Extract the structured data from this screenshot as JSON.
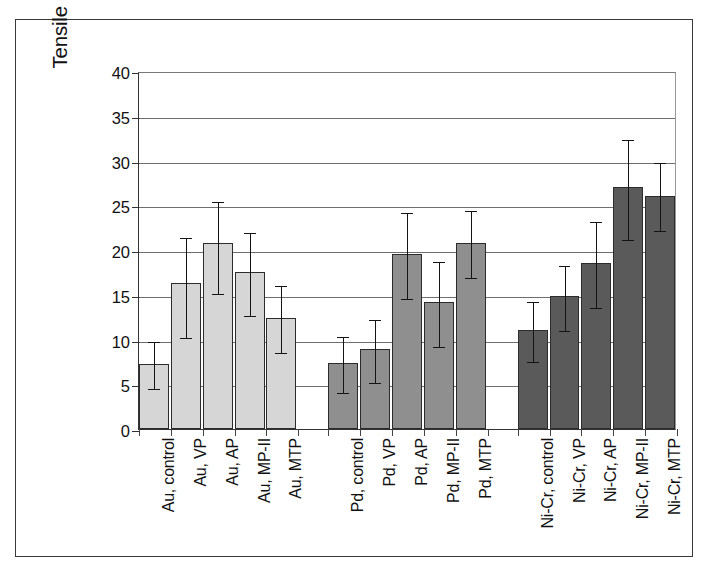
{
  "chart_data": {
    "type": "bar",
    "title": "",
    "xlabel": "",
    "ylabel": "Tensile bond strength (MPa)",
    "ylim": [
      0,
      40
    ],
    "yticks": [
      0,
      5,
      10,
      15,
      20,
      25,
      30,
      35,
      40
    ],
    "ytick_labels": [
      "0",
      "5",
      "10",
      "15",
      "20",
      "25",
      "30",
      "35",
      "40"
    ],
    "grid": true,
    "legend": "none",
    "error_bars": "yes",
    "categories": [
      "Au, control",
      "Au, VP",
      "Au, AP",
      "Au, MP-II",
      "Au, MTP",
      "Pd, control",
      "Pd, VP",
      "Pd, AP",
      "Pd, MP-II",
      "Pd, MTP",
      "Ni-Cr, control",
      "Ni-Cr, VP",
      "Ni-Cr, AP",
      "Ni-Cr, MP-II",
      "Ni-Cr, MTP"
    ],
    "values": [
      7.3,
      16.3,
      20.8,
      17.5,
      12.4,
      7.4,
      8.9,
      19.5,
      14.2,
      20.8,
      11.1,
      14.9,
      18.5,
      27.0,
      26.0
    ],
    "err_low": [
      4.7,
      10.4,
      15.3,
      12.9,
      8.7,
      4.3,
      5.4,
      14.8,
      9.4,
      17.1,
      7.7,
      11.2,
      13.7,
      21.3,
      22.3
    ],
    "err_high": [
      10.0,
      21.6,
      25.6,
      22.1,
      16.2,
      10.5,
      12.4,
      24.4,
      18.9,
      24.6,
      14.4,
      18.4,
      23.3,
      32.5,
      30.0
    ],
    "groups": [
      {
        "name": "Au",
        "color": "#d6d6d6",
        "start": 0,
        "count": 5
      },
      {
        "name": "Pd",
        "color": "#8f8f8f",
        "start": 5,
        "count": 5
      },
      {
        "name": "Ni-Cr",
        "color": "#5a5a5a",
        "start": 10,
        "count": 5
      }
    ],
    "colors": {
      "au_bar": "#d6d6d6",
      "pd_bar": "#8f8f8f",
      "nicr_bar": "#5a5a5a",
      "axis": "#333333",
      "gridline": "#6e6e6e",
      "error_bar": "#141414",
      "frame": "#3a3a3a"
    }
  }
}
